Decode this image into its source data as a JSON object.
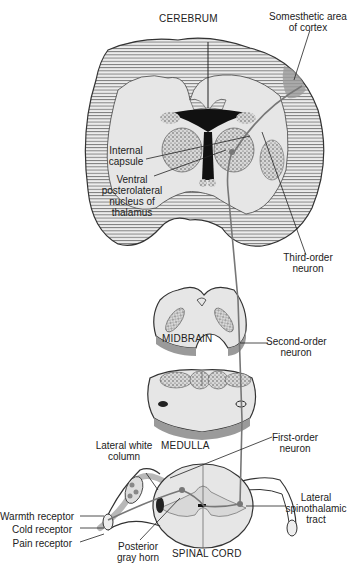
{
  "diagram": {
    "type": "anatomical pathway diagram",
    "structures": {
      "cerebrum": "CEREBRUM",
      "midbrain": "MIDBRAIN",
      "medulla": "MEDULLA",
      "spinal_cord": "SPINAL CORD"
    },
    "labels": {
      "somesthetic_1": "Somesthetic area",
      "somesthetic_2": "of cortex",
      "internal_capsule_1": "Internal",
      "internal_capsule_2": "capsule",
      "vpl_1": "Ventral",
      "vpl_2": "posterolateral",
      "vpl_3": "nucleus of",
      "vpl_4": "thalamus",
      "third_order_1": "Third-order",
      "third_order_2": "neuron",
      "second_order_1": "Second-order",
      "second_order_2": "neuron",
      "first_order_1": "First-order",
      "first_order_2": "neuron",
      "lateral_white_1": "Lateral white",
      "lateral_white_2": "column",
      "lst_1": "Lateral",
      "lst_2": "spinothalamic",
      "lst_3": "tract",
      "warmth": "Warmth receptor",
      "cold": "Cold receptor",
      "pain": "Pain receptor",
      "posterior_horn_1": "Posterior",
      "posterior_horn_2": "gray horn"
    },
    "colors": {
      "tissue": "#e8e8e8",
      "outline": "#333333",
      "neuron": "#777777",
      "shade": "#9a9a9a"
    }
  }
}
